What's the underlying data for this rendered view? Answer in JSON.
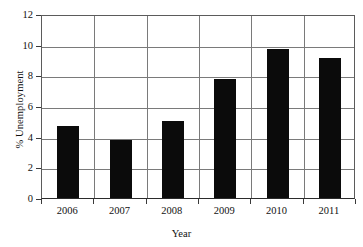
{
  "chart_data": {
    "type": "bar",
    "title": "",
    "xlabel": "Year",
    "ylabel": "% Unemployment",
    "categories": [
      "2006",
      "2007",
      "2008",
      "2009",
      "2010",
      "2011"
    ],
    "values": [
      4.7,
      3.8,
      5.0,
      7.75,
      9.75,
      9.15
    ],
    "ylim": [
      0,
      12
    ],
    "yticks": [
      "0",
      "2",
      "4",
      "6",
      "8",
      "10",
      "12"
    ],
    "ytick_values": [
      0,
      2,
      4,
      6,
      8,
      10,
      12
    ],
    "grid": "horizontal-and-vertical",
    "legend": "none",
    "bar_color": "#0b0b0b",
    "grid_color": "#7a7a7a",
    "axis_color": "#3a3a3a",
    "background": "#ffffff"
  },
  "figure": {
    "top_artifact_text": "",
    "series_name": "% Unemployment"
  }
}
